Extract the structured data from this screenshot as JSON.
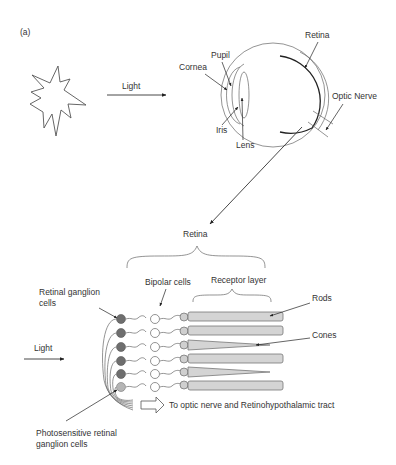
{
  "figure": {
    "panel_label": "(a)",
    "top": {
      "light_label": "Light",
      "eye_labels": {
        "pupil": "Pupil",
        "cornea": "Cornea",
        "iris": "Iris",
        "lens": "Lens",
        "retina": "Retina",
        "optic_nerve": "Optic Nerve"
      }
    },
    "bottom": {
      "retina_label": "Retina",
      "receptor_layer": "Receptor layer",
      "bipolar_cells": "Bipolar cells",
      "retinal_ganglion_cells_line1": "Retinal ganglion",
      "retinal_ganglion_cells_line2": "cells",
      "rods": "Rods",
      "cones": "Cones",
      "light_label": "Light",
      "output_arrow_label": "To optic nerve and Retinohypothalamic tract",
      "iprgc_line1": "Photosensitive retinal",
      "iprgc_line2": "ganglion cells",
      "rows": [
        {
          "ganglion": "retinal-ganglion",
          "receptor": "rod"
        },
        {
          "ganglion": "retinal-ganglion",
          "receptor": "rod"
        },
        {
          "ganglion": "retinal-ganglion",
          "receptor": "cone"
        },
        {
          "ganglion": "retinal-ganglion",
          "receptor": "rod"
        },
        {
          "ganglion": "retinal-ganglion",
          "receptor": "cone"
        },
        {
          "ganglion": "photosensitive-ganglion",
          "receptor": "rod"
        }
      ]
    },
    "colors": {
      "ganglion_fill": "#6e6e6e",
      "photosensitive_fill": "#b5b5b5",
      "receptor_fill": "#d4d4d4",
      "line": "#555555",
      "text": "#333333"
    }
  }
}
